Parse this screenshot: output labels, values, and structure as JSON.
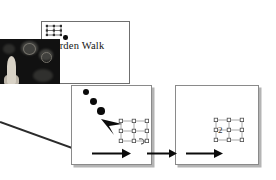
{
  "document": {
    "title": "Garden Walk",
    "background_color": "#ffffff"
  },
  "poster": {
    "name": "garden-walk-poster",
    "title": "Garden Walk",
    "title_color": "#141414",
    "border_color": "#6f6f6f",
    "photo": {
      "name": "garden-statue-photograph",
      "background_color": "#111111",
      "subject": "pale statue figure in dark garden"
    },
    "mini_lattice": {
      "name": "mini-lattice-icon",
      "rows": 3,
      "cols": 3,
      "node_color": "#3a3a3a"
    }
  },
  "panels": [
    {
      "name": "slide-panel-1",
      "border_color": "#8a8a8a",
      "shadow_color": "#b4b4b4",
      "has_arrowhead": true,
      "has_dot_trail": true,
      "lattice": {
        "name": "lattice-structure-1",
        "rows": 3,
        "cols": 3,
        "node_color": "#555555",
        "bond_color": "#8b8b8b"
      }
    },
    {
      "name": "slide-panel-2",
      "border_color": "#8a8a8a",
      "shadow_color": "#b4b4b4",
      "has_arrowhead": false,
      "has_dot_trail": false,
      "lattice": {
        "name": "lattice-structure-2",
        "rows": 3,
        "cols": 3,
        "node_color": "#555555",
        "bond_color": "#8b8b8b",
        "label": "2"
      }
    }
  ],
  "dot_trail": {
    "name": "dot-trail",
    "color": "#0a0a0a",
    "dots": [
      {
        "x": 12,
        "y": 4,
        "r": 3.0
      },
      {
        "x": 19,
        "y": 13,
        "r": 3.4
      },
      {
        "x": 26,
        "y": 22,
        "r": 3.9
      },
      {
        "x": 33,
        "y": 31,
        "r": 4.4
      }
    ]
  },
  "arrowhead": {
    "name": "large-arrowhead",
    "color": "#0b0b0b",
    "direction": "down-right"
  },
  "flow_arrows": [
    {
      "name": "flow-arrow-1",
      "color": "#0b0b0b",
      "direction": "right"
    },
    {
      "name": "flow-arrow-2",
      "color": "#0b0b0b",
      "direction": "right"
    },
    {
      "name": "flow-arrow-3",
      "color": "#0b0b0b",
      "direction": "right"
    }
  ],
  "pointer_line": {
    "name": "callout-pointer-line",
    "color": "#2b2b2b",
    "direction": "from-left-edge-up-to-right"
  }
}
